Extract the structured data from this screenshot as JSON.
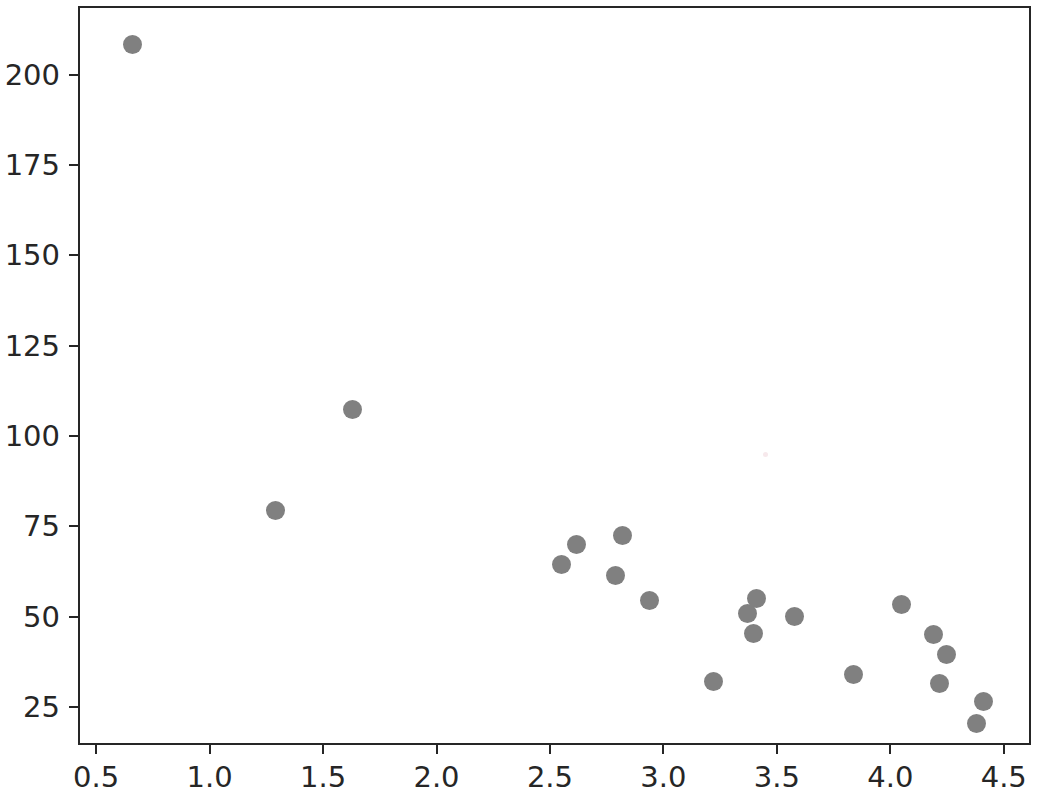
{
  "chart_data": {
    "type": "scatter",
    "title": "",
    "xlabel": "",
    "ylabel": "",
    "xlim": [
      0.42,
      4.62
    ],
    "ylim": [
      14.5,
      219.0
    ],
    "grid": false,
    "legend": null,
    "marker": {
      "color": "#808080",
      "shape": "circle",
      "size_px": 19
    },
    "xticks": [
      0.5,
      1.0,
      1.5,
      2.0,
      2.5,
      3.0,
      3.5,
      4.0,
      4.5
    ],
    "xticklabels": [
      "0.5",
      "1.0",
      "1.5",
      "2.0",
      "2.5",
      "3.0",
      "3.5",
      "4.0",
      "4.5"
    ],
    "yticks": [
      25,
      50,
      75,
      100,
      125,
      150,
      175,
      200
    ],
    "yticklabels": [
      "25",
      "50",
      "75",
      "100",
      "125",
      "150",
      "175",
      "200"
    ],
    "points": [
      {
        "x": 0.65,
        "y": 209.0
      },
      {
        "x": 1.28,
        "y": 80.0
      },
      {
        "x": 1.62,
        "y": 108.0
      },
      {
        "x": 2.54,
        "y": 65.0
      },
      {
        "x": 2.61,
        "y": 70.5
      },
      {
        "x": 2.78,
        "y": 62.0
      },
      {
        "x": 2.81,
        "y": 73.0
      },
      {
        "x": 2.93,
        "y": 55.0
      },
      {
        "x": 3.21,
        "y": 32.5
      },
      {
        "x": 3.36,
        "y": 51.5
      },
      {
        "x": 3.4,
        "y": 55.5
      },
      {
        "x": 3.39,
        "y": 46.0
      },
      {
        "x": 3.57,
        "y": 50.5
      },
      {
        "x": 3.83,
        "y": 34.5
      },
      {
        "x": 4.04,
        "y": 54.0
      },
      {
        "x": 4.18,
        "y": 45.5
      },
      {
        "x": 4.24,
        "y": 40.0
      },
      {
        "x": 4.21,
        "y": 32.0
      },
      {
        "x": 4.4,
        "y": 27.0
      },
      {
        "x": 4.37,
        "y": 21.0
      }
    ],
    "artifacts": [
      {
        "x": 3.44,
        "y": 95.5,
        "color": "#f7e9ec"
      }
    ]
  }
}
